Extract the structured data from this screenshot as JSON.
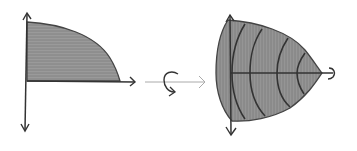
{
  "diagram": {
    "type": "solid-of-revolution-sketch",
    "colors": {
      "background": "#ffffff",
      "fill": "#8e8e8e",
      "fill_light": "#b5b5b5",
      "stroke": "#333333",
      "arrow_stroke": "#aaaaaa"
    },
    "panels": [
      {
        "id": "region",
        "label": "Quarter region under curve in first quadrant"
      },
      {
        "id": "rotation",
        "label": "Rotate about x-axis"
      },
      {
        "id": "solid",
        "label": "Resulting solid of revolution with cross-section rings"
      }
    ]
  }
}
